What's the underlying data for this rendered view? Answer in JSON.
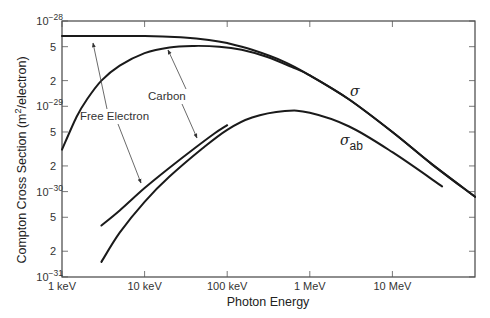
{
  "chart_data": {
    "type": "line",
    "title": "",
    "xlabel": "Photon Energy",
    "ylabel": "Compton Cross Section (m²/electron)",
    "xscale": "log",
    "yscale": "log",
    "x_unit": "keV",
    "xlim": [
      1,
      100000
    ],
    "ylim": [
      1e-31,
      1e-28
    ],
    "grid": false,
    "x_ticks": [
      {
        "value": 1,
        "label": "1 keV"
      },
      {
        "value": 10,
        "label": "10 keV"
      },
      {
        "value": 100,
        "label": "100 keV"
      },
      {
        "value": 1000,
        "label": "1 MeV"
      },
      {
        "value": 10000,
        "label": "10 MeV"
      }
    ],
    "y_ticks": [
      {
        "value": 1e-28,
        "label": "10",
        "exp": "−28"
      },
      {
        "value": 5e-29,
        "label": "5"
      },
      {
        "value": 2e-29,
        "label": "2"
      },
      {
        "value": 1e-29,
        "label": "10",
        "exp": "−29"
      },
      {
        "value": 5e-30,
        "label": "5"
      },
      {
        "value": 2e-30,
        "label": "2"
      },
      {
        "value": 1e-30,
        "label": "10",
        "exp": "−30"
      },
      {
        "value": 5e-31,
        "label": "5"
      },
      {
        "value": 2e-31,
        "label": "2"
      },
      {
        "value": 1e-31,
        "label": "10",
        "exp": "−31"
      }
    ],
    "series": [
      {
        "name": "σ (Free Electron)",
        "x": [
          1,
          10,
          30,
          60,
          100,
          200,
          500,
          1000,
          3000,
          10000,
          30000,
          100000
        ],
        "y": [
          6.65e-29,
          6.65e-29,
          6.4e-29,
          6e-29,
          5.5e-29,
          4.6e-29,
          3.3e-29,
          2.3e-29,
          1.2e-29,
          5e-30,
          2.1e-30,
          8.7e-31
        ]
      },
      {
        "name": "σ (Carbon)",
        "x": [
          1,
          1.5,
          2,
          3,
          5,
          10,
          20,
          40,
          80,
          150,
          300,
          600,
          1000,
          3000,
          10000,
          30000,
          100000
        ],
        "y": [
          3.1e-30,
          7.5e-30,
          1.2e-29,
          2e-29,
          3e-29,
          4.2e-29,
          4.9e-29,
          5.1e-29,
          5e-29,
          4.6e-29,
          3.8e-29,
          2.9e-29,
          2.3e-29,
          1.2e-29,
          5e-30,
          2.1e-30,
          8.7e-31
        ]
      },
      {
        "name": "σ_ab (Free Electron)",
        "x": [
          3,
          5,
          10,
          20,
          40,
          70,
          100
        ],
        "y": [
          4e-31,
          6e-31,
          1.1e-30,
          1.9e-30,
          3.2e-30,
          4.8e-30,
          6e-30
        ]
      },
      {
        "name": "σ_ab (Carbon)",
        "x": [
          3,
          5,
          10,
          20,
          50,
          100,
          200,
          500,
          1000,
          3000,
          10000,
          40000
        ],
        "y": [
          1.5e-31,
          3.3e-31,
          7.6e-31,
          1.5e-30,
          3.2e-30,
          5.3e-30,
          7.4e-30,
          8.8e-30,
          8.4e-30,
          5.8e-30,
          2.9e-30,
          1.15e-30
        ]
      }
    ],
    "annotations": [
      {
        "text": "Free Electron",
        "arrows_to": [
          "σ (Free Electron)",
          "σ_ab (Free Electron)"
        ]
      },
      {
        "text": "Carbon",
        "arrows_to": [
          "σ (Carbon)",
          "σ_ab (Carbon)"
        ]
      },
      {
        "text": "σ",
        "labels": "total Compton cross section"
      },
      {
        "text": "σab",
        "labels": "Compton absorption cross section"
      }
    ]
  },
  "labels": {
    "xlabel": "Photon Energy",
    "ylabel_main": "Compton  Cross  Section  (m",
    "ylabel_sup": "2",
    "ylabel_end": "/electron)",
    "free_electron": "Free  Electron",
    "carbon": "Carbon",
    "sigma": "σ",
    "sigma_ab_main": "σ",
    "sigma_ab_sub": "ab"
  }
}
